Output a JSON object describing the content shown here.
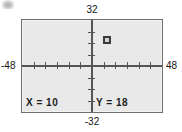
{
  "screen": {
    "device": "graphing-calculator-screen",
    "background_color": "#e9e9e9",
    "border_color": "#6f6f6f"
  },
  "window_bounds": {
    "xmin_label": "-48",
    "xmax_label": "48",
    "ymin_label": "-32",
    "ymax_label": "32"
  },
  "readouts": {
    "x_label": "X = 10",
    "y_label": "Y = 18"
  },
  "chart_data": {
    "type": "scatter",
    "title": "",
    "xlabel": "",
    "ylabel": "",
    "xlim": [
      -48,
      48
    ],
    "ylim": [
      -32,
      32
    ],
    "grid": false,
    "legend": null,
    "axes": {
      "x_axis_shown": true,
      "y_axis_shown": true,
      "x_tick_interval": 8,
      "y_tick_interval": 8,
      "x_ticks": [
        -40,
        -32,
        -24,
        -16,
        -8,
        8,
        16,
        24,
        32,
        40
      ],
      "y_ticks": [
        -24,
        -16,
        -8,
        8,
        16,
        24
      ]
    },
    "points": [
      {
        "name": "trace-cursor",
        "x": 10,
        "y": 18,
        "marker": "square"
      }
    ],
    "annotations": [
      {
        "name": "x-readout",
        "text": "X = 10",
        "position": "bottom-left-inside"
      },
      {
        "name": "y-readout",
        "text": "Y = 18",
        "position": "bottom-center-inside"
      },
      {
        "name": "ymax-bound",
        "text": "32",
        "position": "above-frame"
      },
      {
        "name": "ymin-bound",
        "text": "-32",
        "position": "below-frame"
      },
      {
        "name": "xmin-bound",
        "text": "-48",
        "position": "left-of-frame"
      },
      {
        "name": "xmax-bound",
        "text": "48",
        "position": "right-of-frame"
      }
    ]
  }
}
